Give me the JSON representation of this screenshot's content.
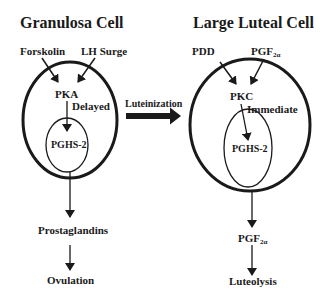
{
  "diagram": {
    "colors": {
      "stroke": "#1a1a1a",
      "background": "#ffffff"
    },
    "left_cell": {
      "title": "Granulosa Cell",
      "inputs": [
        "Forskolin",
        "LH Surge"
      ],
      "kinase": "PKA",
      "timing": "Delayed",
      "enzyme": "PGHS-2",
      "product": "Prostaglandins",
      "outcome": "Ovulation"
    },
    "transition": {
      "label": "Luteinization"
    },
    "right_cell": {
      "title": "Large Luteal Cell",
      "inputs": [
        "PDD",
        "PGF"
      ],
      "input_subscript": "2α",
      "kinase": "PKC",
      "timing": "Immediate",
      "enzyme": "PGHS-2",
      "product": "PGF",
      "product_subscript": "2α",
      "outcome": "Luteolysis"
    }
  }
}
